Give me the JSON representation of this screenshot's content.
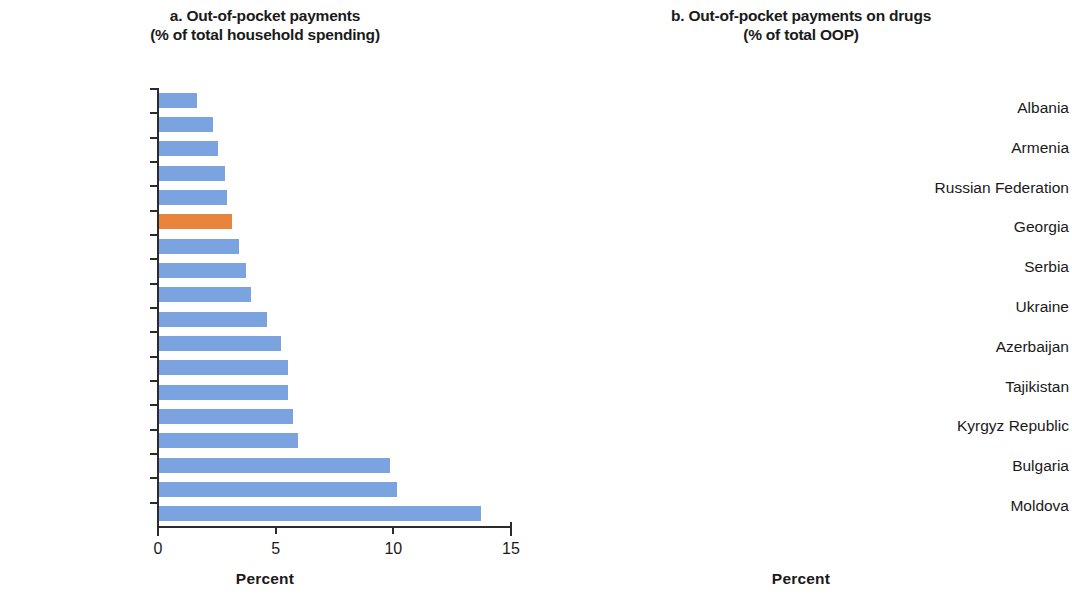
{
  "chart_data": [
    {
      "type": "bar",
      "orientation": "horizontal",
      "panel": "a",
      "title": "a. Out-of-pocket payments",
      "subtitle": "(% of total household spending)",
      "xlabel": "Percent",
      "ylabel": "",
      "xlim": [
        0,
        15
      ],
      "xticks": [
        0,
        5,
        10,
        15
      ],
      "xticklabels": [
        "0",
        "5",
        "10",
        "15"
      ],
      "grid": false,
      "legend": false,
      "bar_color": "#7ba3e0",
      "highlight_color": "#e8843b",
      "highlight_category": "EU-15",
      "categories": [
        "Turkey",
        "Slovenia",
        "Czech Republic",
        "Poland",
        "Estonia",
        "EU-15",
        "Hungary",
        "Serbia",
        "Slovak Republic",
        "Russian Federation",
        "Albania",
        "Moldova",
        "Tajikistan",
        "Armenia",
        "Bulgaria",
        "Ukraine",
        "Azerbaijan",
        "Georgia"
      ],
      "values": [
        1.6,
        2.3,
        2.5,
        2.8,
        2.9,
        3.1,
        3.4,
        3.7,
        3.9,
        4.6,
        5.2,
        5.5,
        5.5,
        5.7,
        5.9,
        9.8,
        10.1,
        13.7
      ]
    },
    {
      "type": "bar",
      "orientation": "horizontal",
      "panel": "b",
      "title": "b. Out-of-pocket payments on drugs",
      "subtitle": "(% of total OOP)",
      "xlabel": "Percent",
      "ylabel": "",
      "xlim": [
        0,
        100
      ],
      "xticks": [
        0,
        20,
        40,
        60,
        80,
        100
      ],
      "xticklabels": [
        "0",
        "20",
        "40",
        "60",
        "80",
        "100"
      ],
      "grid": false,
      "legend": false,
      "bar_color": "#7ba3e0",
      "categories": [
        "Albania",
        "Armenia",
        "Russian Federation",
        "Georgia",
        "Serbia",
        "Ukraine",
        "Azerbaijan",
        "Tajikistan",
        "Kyrgyz Republic",
        "Bulgaria",
        "Moldova"
      ],
      "values": [
        41.5,
        41.5,
        47.5,
        50,
        50,
        50,
        61,
        68.5,
        68.5,
        73,
        76
      ]
    }
  ]
}
